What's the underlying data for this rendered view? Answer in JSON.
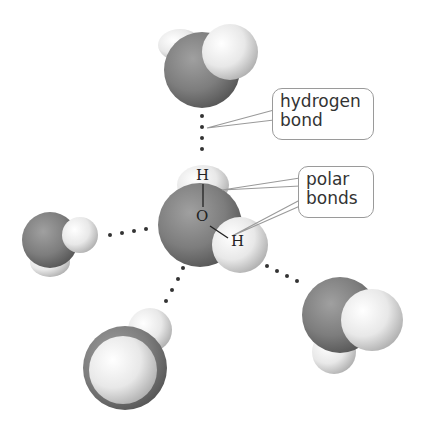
{
  "diagram": {
    "type": "water-molecule-hydrogen-bonding",
    "callouts": {
      "hydrogen_bond": {
        "line1": "hydrogen",
        "line2": "bond"
      },
      "polar_bonds": {
        "line1": "polar",
        "line2": "bonds"
      }
    },
    "atom_labels": {
      "hydrogen_top": "H",
      "oxygen": "O",
      "hydrogen_right": "H"
    },
    "molecules": [
      {
        "id": "top",
        "role": "neighbor"
      },
      {
        "id": "center",
        "role": "central"
      },
      {
        "id": "left",
        "role": "neighbor"
      },
      {
        "id": "bottom-left",
        "role": "neighbor"
      },
      {
        "id": "bottom-right",
        "role": "neighbor"
      }
    ],
    "colors": {
      "oxygen": "#7f7f7f",
      "oxygen_dark": "#555555",
      "hydrogen": "#f2f2f2",
      "hydrogen_shade": "#b8b8b8",
      "callout_border": "#9a9a9a",
      "dots": "#333333"
    }
  }
}
